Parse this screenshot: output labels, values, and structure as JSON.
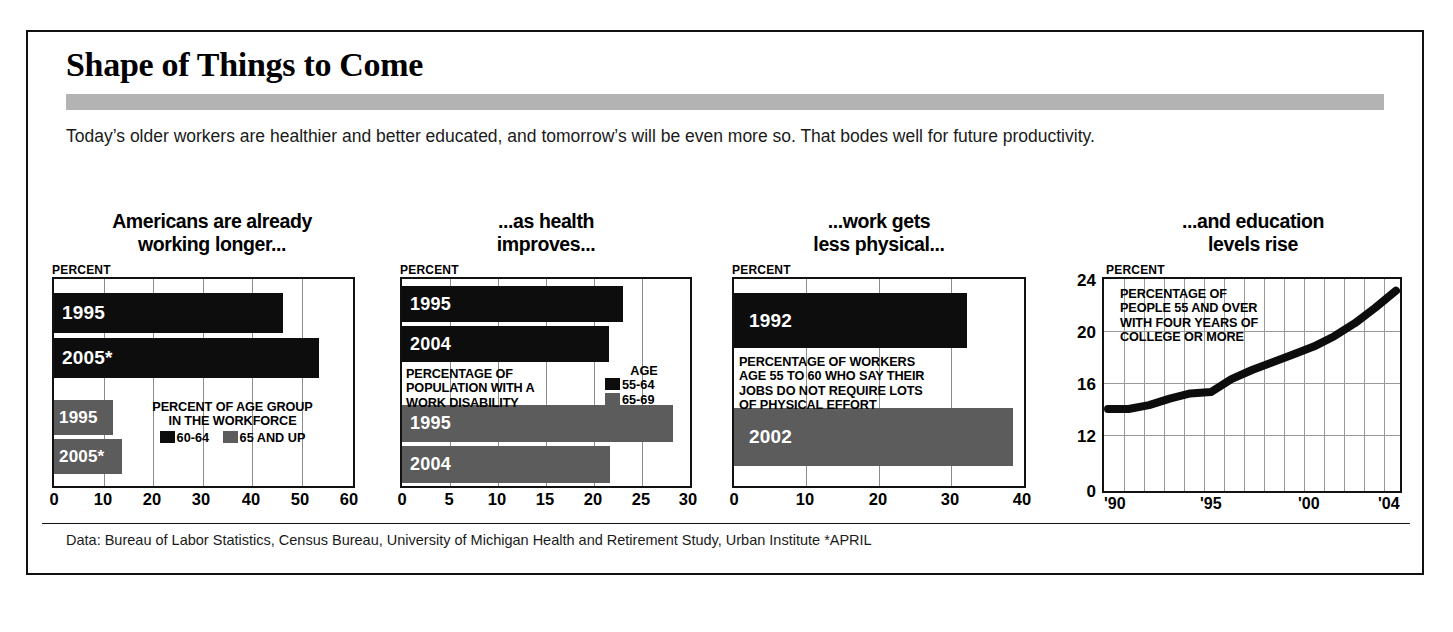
{
  "title": "Shape of Things to Come",
  "intro": "Today’s older workers are healthier and better educated, and tomorrow’s will be even more so. That bodes well for future productivity.",
  "footer": "Data: Bureau of Labor Statistics, Census Bureau, University of Michigan Health and Retirement Study, Urban Institute *APRIL",
  "axis_label": "PERCENT",
  "colors": {
    "dark": "#0d0d0d",
    "gray": "#5c5c5c",
    "band": "#b3b3b3",
    "grid": "#8c8c8c",
    "frame": "#111111"
  },
  "chart_data": [
    {
      "type": "bar",
      "orientation": "horizontal",
      "title": "Americans are already working longer...",
      "title_lines": [
        "Americans are already",
        "working longer..."
      ],
      "ylabel": "",
      "xlabel": "PERCENT",
      "note": [
        "PERCENT OF AGE GROUP",
        "IN THE WORKFORCE"
      ],
      "legend": [
        {
          "label": "60-64",
          "color": "dark"
        },
        {
          "label": "65 AND UP",
          "color": "gray"
        }
      ],
      "legend_position": "inside-center",
      "xlim": [
        0,
        60
      ],
      "xticks": [
        0,
        10,
        20,
        30,
        40,
        50,
        60
      ],
      "grid": true,
      "bars": [
        {
          "label": "1995",
          "value": 45.5,
          "series": "60-64",
          "color": "dark"
        },
        {
          "label": "2005*",
          "value": 52.5,
          "series": "60-64",
          "color": "dark"
        },
        {
          "label": "1995",
          "value": 11.7,
          "series": "65 AND UP",
          "color": "gray"
        },
        {
          "label": "2005*",
          "value": 13.4,
          "series": "65 AND UP",
          "color": "gray"
        }
      ]
    },
    {
      "type": "bar",
      "orientation": "horizontal",
      "title": "...as health improves...",
      "title_lines": [
        "...as health",
        "improves..."
      ],
      "xlabel": "PERCENT",
      "note": [
        "PERCENTAGE OF",
        "POPULATION WITH A",
        "WORK DISABILITY"
      ],
      "legend_title": "AGE",
      "legend": [
        {
          "label": "55-64",
          "color": "dark"
        },
        {
          "label": "65-69",
          "color": "gray"
        }
      ],
      "legend_position": "inside-right",
      "xlim": [
        0,
        30
      ],
      "xticks": [
        0,
        5,
        10,
        15,
        20,
        25,
        30
      ],
      "grid": true,
      "bars": [
        {
          "label": "1995",
          "value": 23.0,
          "series": "55-64",
          "color": "dark"
        },
        {
          "label": "2004",
          "value": 21.6,
          "series": "55-64",
          "color": "dark"
        },
        {
          "label": "1995",
          "value": 28.2,
          "series": "65-69",
          "color": "gray"
        },
        {
          "label": "2004",
          "value": 21.7,
          "series": "65-69",
          "color": "gray"
        }
      ]
    },
    {
      "type": "bar",
      "orientation": "horizontal",
      "title": "...work gets less physical...",
      "title_lines": [
        "...work gets",
        "less physical..."
      ],
      "xlabel": "PERCENT",
      "note": [
        "PERCENTAGE OF WORKERS",
        "AGE 55 TO 60 WHO SAY THEIR",
        "JOBS DO NOT REQUIRE LOTS",
        "OF PHYSICAL EFFORT"
      ],
      "legend": [],
      "xlim": [
        0,
        40
      ],
      "xticks": [
        0,
        10,
        20,
        30,
        40
      ],
      "grid": true,
      "bars": [
        {
          "label": "1992",
          "value": 32.0,
          "color": "dark"
        },
        {
          "label": "2002",
          "value": 38.3,
          "color": "gray"
        }
      ]
    },
    {
      "type": "line",
      "title": "...and education levels rise",
      "title_lines": [
        "...and education",
        "levels rise"
      ],
      "ylabel": "PERCENT",
      "note": [
        "PERCENTAGE OF",
        "PEOPLE 55 AND OVER",
        "WITH FOUR YEARS OF",
        "COLLEGE OR MORE"
      ],
      "ylim": [
        12,
        24
      ],
      "yticks": [
        0,
        12,
        16,
        20,
        24
      ],
      "xticks": [
        "'90",
        "'95",
        "'00",
        "'04"
      ],
      "grid": true,
      "x": [
        1990,
        1991,
        1992,
        1993,
        1994,
        1995,
        1996,
        1997,
        1998,
        1999,
        2000,
        2001,
        2002,
        2003,
        2004
      ],
      "values": [
        14.0,
        14.0,
        14.3,
        14.8,
        15.2,
        15.3,
        16.3,
        17.0,
        17.6,
        18.2,
        18.8,
        19.6,
        20.6,
        21.8,
        23.1
      ]
    }
  ]
}
